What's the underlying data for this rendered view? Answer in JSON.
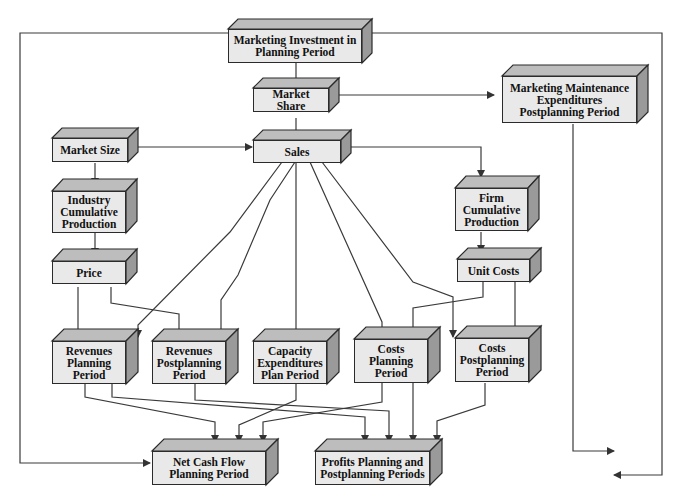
{
  "diagram": {
    "type": "flowchart",
    "style": {
      "face_color": "#e9e9e9",
      "top_color": "#bdbdbd",
      "side_color": "#9a9a9a",
      "line_color": "#333333"
    },
    "nodes": {
      "marketing_investment": {
        "label": "Marketing Investment in Planning Period"
      },
      "market_share": {
        "label": "Market Share"
      },
      "marketing_maintenance": {
        "label": "Marketing Maintenance Expenditures Postplanning Period"
      },
      "market_size": {
        "label": "Market Size"
      },
      "sales": {
        "label": "Sales"
      },
      "industry_cumulative": {
        "label": "Industry Cumulative Production"
      },
      "firm_cumulative": {
        "label": "Firm Cumulative Production"
      },
      "price": {
        "label": "Price"
      },
      "unit_costs": {
        "label": "Unit Costs"
      },
      "revenues_planning": {
        "label": "Revenues Planning Period"
      },
      "revenues_postplanning": {
        "label": "Revenues Postplanning Period"
      },
      "capacity_expenditures": {
        "label": "Capacity Expenditures Plan Period"
      },
      "costs_planning": {
        "label": "Costs Planning Period"
      },
      "costs_postplanning": {
        "label": "Costs Postplanning Period"
      },
      "net_cash_flow": {
        "label": "Net Cash Flow Planning Period"
      },
      "profits": {
        "label": "Profits Planning and Postplanning Periods"
      }
    },
    "edges": [
      [
        "marketing_investment",
        "market_share"
      ],
      [
        "marketing_investment",
        "net_cash_flow"
      ],
      [
        "marketing_investment",
        "profits"
      ],
      [
        "market_share",
        "sales"
      ],
      [
        "market_share",
        "marketing_maintenance"
      ],
      [
        "market_size",
        "sales"
      ],
      [
        "market_size",
        "industry_cumulative"
      ],
      [
        "industry_cumulative",
        "price"
      ],
      [
        "sales",
        "firm_cumulative"
      ],
      [
        "firm_cumulative",
        "unit_costs"
      ],
      [
        "sales",
        "revenues_planning"
      ],
      [
        "sales",
        "revenues_postplanning"
      ],
      [
        "sales",
        "capacity_expenditures"
      ],
      [
        "sales",
        "costs_planning"
      ],
      [
        "sales",
        "costs_postplanning"
      ],
      [
        "price",
        "revenues_planning"
      ],
      [
        "price",
        "revenues_postplanning"
      ],
      [
        "unit_costs",
        "costs_planning"
      ],
      [
        "unit_costs",
        "costs_postplanning"
      ],
      [
        "marketing_maintenance",
        "profits"
      ],
      [
        "revenues_planning",
        "net_cash_flow"
      ],
      [
        "revenues_planning",
        "profits"
      ],
      [
        "revenues_postplanning",
        "profits"
      ],
      [
        "capacity_expenditures",
        "net_cash_flow"
      ],
      [
        "costs_planning",
        "net_cash_flow"
      ],
      [
        "costs_planning",
        "profits"
      ],
      [
        "costs_postplanning",
        "profits"
      ]
    ]
  }
}
